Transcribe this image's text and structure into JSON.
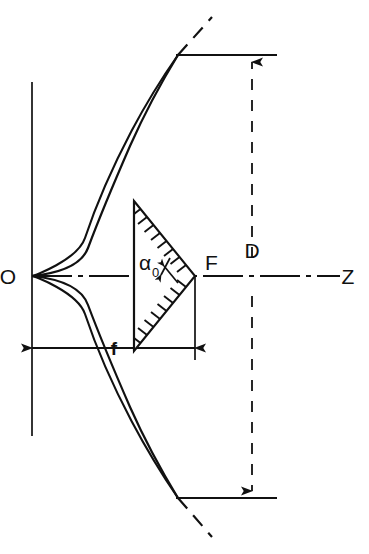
{
  "figure": {
    "background_color": "#ffffff",
    "line_color": "#111111",
    "width": 369,
    "height": 554
  },
  "labels": {
    "vertex": "O",
    "focus": "F",
    "axis": "Z",
    "focal_length": "f",
    "aperture_diameter": "D",
    "half_angle": "α",
    "half_angle_subscript": "0"
  },
  "geometry": {
    "vertex_point": {
      "x": 32,
      "y": 276
    },
    "focus_point": {
      "x": 195,
      "y": 276
    },
    "axis_y": 276,
    "focal_length_px": 163,
    "aperture_top_y": 55,
    "aperture_bottom_y": 498,
    "aperture_diameter_px": 443,
    "aperture_edge_x": 178,
    "dimension_line_x": 272,
    "f_dimension_y": 348,
    "tangent_line_x": 32,
    "tangent_top_y": 82,
    "tangent_bottom_y": 436,
    "axis_end_x": 340,
    "half_angle_deg": 55
  },
  "elements": {
    "reflector": "parabolic-reflector-curve",
    "reflector_dashed_extension": "parabola-dashed-extension",
    "feed_horn": "hatched-triangular-feed-horn",
    "axis_style": "dash-dot-center-line",
    "d_dimension_style": "dashed-with-arrowheads",
    "f_dimension_style": "solid-with-arrowheads"
  }
}
